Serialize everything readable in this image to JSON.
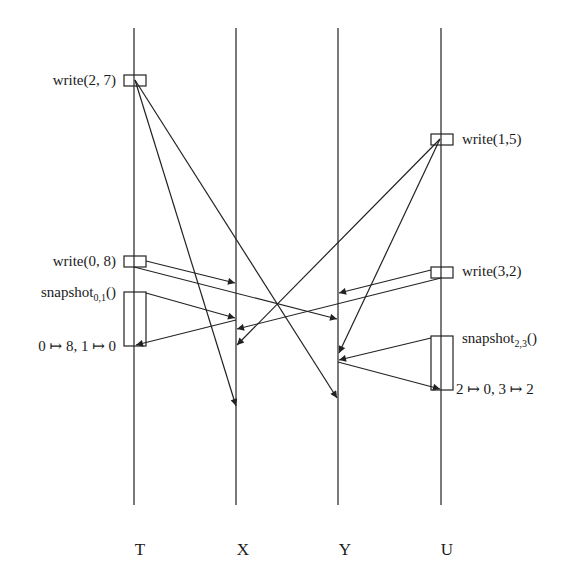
{
  "diagram": {
    "type": "space-time / message sequence diagram",
    "processes": [
      {
        "id": "T",
        "label": "T",
        "x": 134
      },
      {
        "id": "X",
        "label": "X",
        "x": 236
      },
      {
        "id": "Y",
        "label": "Y",
        "x": 338
      },
      {
        "id": "U",
        "label": "U",
        "x": 441
      }
    ],
    "operations": [
      {
        "process": "T",
        "label": "write(2, 7)",
        "side": "left"
      },
      {
        "process": "U",
        "label": "write(1,5)",
        "side": "right"
      },
      {
        "process": "T",
        "label": "write(0, 8)",
        "side": "left"
      },
      {
        "process": "U",
        "label": "write(3,2)",
        "side": "right"
      },
      {
        "process": "T",
        "label_main": "snapshot",
        "label_sub": "0,1",
        "label_tail": "()",
        "side": "left",
        "result": "0 ↦ 8, 1 ↦ 0"
      },
      {
        "process": "U",
        "label_main": "snapshot",
        "label_sub": "2,3",
        "label_tail": "()",
        "side": "right",
        "result": "2 ↦ 0, 3 ↦ 2"
      }
    ],
    "messages": [
      {
        "from": "T write(2,7)",
        "to": "X"
      },
      {
        "from": "T write(2,7)",
        "to": "Y"
      },
      {
        "from": "U write(1,5)",
        "to": "X"
      },
      {
        "from": "U write(1,5)",
        "to": "Y"
      },
      {
        "from": "T write(0,8)",
        "to": "X"
      },
      {
        "from": "T write(0,8)",
        "to": "Y"
      },
      {
        "from": "U write(3,2)",
        "to": "Y"
      },
      {
        "from": "U write(3,2)",
        "to": "X"
      },
      {
        "from": "T snapshot",
        "to": "X"
      },
      {
        "from": "X",
        "to": "T snapshot"
      },
      {
        "from": "U snapshot",
        "to": "Y"
      },
      {
        "from": "Y",
        "to": "U snapshot"
      }
    ]
  }
}
